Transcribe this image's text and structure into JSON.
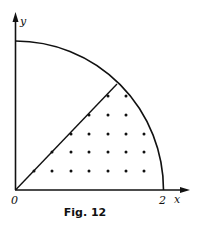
{
  "figure": {
    "caption": "Fig. 12",
    "axes": {
      "x_label": "x",
      "y_label": "y",
      "origin_label": "0",
      "x_tick_label": "2"
    },
    "region": "quarter circle of radius 2 with diagonal line y = x",
    "lattice_points": [
      {
        "x": 34,
        "y": 171
      },
      {
        "x": 52,
        "y": 171
      },
      {
        "x": 71,
        "y": 171
      },
      {
        "x": 89,
        "y": 171
      },
      {
        "x": 108,
        "y": 171
      },
      {
        "x": 126,
        "y": 171
      },
      {
        "x": 144,
        "y": 171
      },
      {
        "x": 52,
        "y": 152
      },
      {
        "x": 71,
        "y": 152
      },
      {
        "x": 89,
        "y": 152
      },
      {
        "x": 108,
        "y": 152
      },
      {
        "x": 126,
        "y": 152
      },
      {
        "x": 144,
        "y": 152
      },
      {
        "x": 71,
        "y": 134
      },
      {
        "x": 89,
        "y": 134
      },
      {
        "x": 108,
        "y": 134
      },
      {
        "x": 126,
        "y": 134
      },
      {
        "x": 144,
        "y": 134
      },
      {
        "x": 89,
        "y": 115
      },
      {
        "x": 108,
        "y": 115
      },
      {
        "x": 126,
        "y": 115
      },
      {
        "x": 108,
        "y": 96
      },
      {
        "x": 126,
        "y": 96
      }
    ]
  }
}
